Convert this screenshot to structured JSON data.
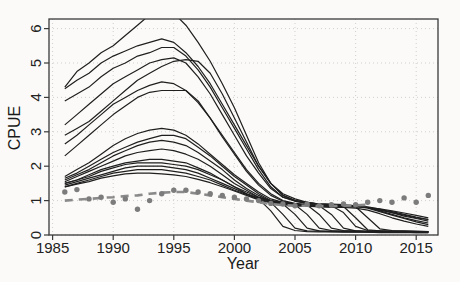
{
  "figure": {
    "kind": "r-base-plot",
    "background": "#fbfaf8"
  },
  "colors": {
    "background": "#fbfaf8",
    "line": "#1f1f1f",
    "points": "#7c7c7c",
    "dashed": "#8a8a8a",
    "grid": "#cfcfcf",
    "frame": "#3a3a3a",
    "text": "#222222"
  },
  "chart_data": {
    "type": "line",
    "title": "",
    "xlabel": "Year",
    "ylabel": "CPUE",
    "xlim": [
      1984.7,
      2016.8
    ],
    "ylim": [
      0,
      6.28
    ],
    "x_ticks": [
      1985,
      1990,
      1995,
      2000,
      2005,
      2010,
      2015
    ],
    "y_ticks": [
      0,
      1,
      2,
      3,
      4,
      5,
      6
    ],
    "grid": "dotted",
    "legend": "none",
    "years": [
      1986,
      1987,
      1988,
      1989,
      1990,
      1991,
      1992,
      1993,
      1994,
      1995,
      1996,
      1997,
      1998,
      1999,
      2000,
      2001,
      2002,
      2003,
      2004,
      2005,
      2006,
      2007,
      2008,
      2009,
      2010,
      2011,
      2012,
      2013,
      2014,
      2015,
      2016
    ],
    "series": [
      {
        "name": "run01",
        "values": [
          4.3,
          4.75,
          5.0,
          5.3,
          5.5,
          5.8,
          6.1,
          6.4,
          6.5,
          6.45,
          6.1,
          5.6,
          5.05,
          4.4,
          3.7,
          2.9,
          2.1,
          1.5,
          1.15,
          1.0,
          0.95,
          0.9,
          0.9,
          0.88,
          0.85,
          0.8,
          0.72,
          0.65,
          0.58,
          0.5,
          0.45
        ]
      },
      {
        "name": "run02",
        "values": [
          4.25,
          4.5,
          4.7,
          5.0,
          5.2,
          5.35,
          5.5,
          5.6,
          5.7,
          5.6,
          5.3,
          4.9,
          4.4,
          3.8,
          3.2,
          2.6,
          2.0,
          1.5,
          1.2,
          1.05,
          0.95,
          0.9,
          0.88,
          0.86,
          0.85,
          0.8,
          0.7,
          0.6,
          0.5,
          0.42,
          0.35
        ]
      },
      {
        "name": "run03",
        "values": [
          3.9,
          4.1,
          4.3,
          4.6,
          4.85,
          5.0,
          5.2,
          5.3,
          5.45,
          5.45,
          5.2,
          4.8,
          4.3,
          3.7,
          3.1,
          2.5,
          1.9,
          1.4,
          1.1,
          1.0,
          0.92,
          0.88,
          0.85,
          0.83,
          0.5,
          0.15,
          0.12,
          0.11,
          0.1,
          0.1,
          0.09
        ]
      },
      {
        "name": "run04",
        "values": [
          3.2,
          3.5,
          3.8,
          4.1,
          4.4,
          4.6,
          4.8,
          5.0,
          5.1,
          5.15,
          5.0,
          4.6,
          4.1,
          3.5,
          2.9,
          2.3,
          1.8,
          1.35,
          1.1,
          0.98,
          0.92,
          0.9,
          0.88,
          0.85,
          0.83,
          0.78,
          0.68,
          0.58,
          0.48,
          0.38,
          0.3
        ]
      },
      {
        "name": "run05",
        "values": [
          2.9,
          3.1,
          3.3,
          3.6,
          3.9,
          4.2,
          4.5,
          4.7,
          4.9,
          5.05,
          5.1,
          5.05,
          4.7,
          4.1,
          3.4,
          2.7,
          2.0,
          1.5,
          1.15,
          1.0,
          0.95,
          0.9,
          0.88,
          0.85,
          0.82,
          0.5,
          0.18,
          0.13,
          0.12,
          0.11,
          0.1
        ]
      },
      {
        "name": "run06",
        "values": [
          2.65,
          2.9,
          3.2,
          3.5,
          3.8,
          4.0,
          4.2,
          4.35,
          4.45,
          4.4,
          4.2,
          3.85,
          3.4,
          2.9,
          2.4,
          1.9,
          1.5,
          1.2,
          1.0,
          0.92,
          0.88,
          0.86,
          0.85,
          0.65,
          0.25,
          0.13,
          0.12,
          0.11,
          0.11,
          0.1,
          0.1
        ]
      },
      {
        "name": "run07",
        "values": [
          2.3,
          2.6,
          2.9,
          3.2,
          3.5,
          3.75,
          4.0,
          4.15,
          4.2,
          4.2,
          4.2,
          3.9,
          3.4,
          2.85,
          2.35,
          1.85,
          1.45,
          1.15,
          0.98,
          0.9,
          0.87,
          0.85,
          0.6,
          0.2,
          0.12,
          0.1,
          0.1,
          0.1,
          0.1,
          0.1,
          0.1
        ]
      },
      {
        "name": "run08",
        "values": [
          1.7,
          1.9,
          2.1,
          2.35,
          2.6,
          2.8,
          2.95,
          3.05,
          3.1,
          3.05,
          2.9,
          2.65,
          2.35,
          2.05,
          1.75,
          1.5,
          1.25,
          1.05,
          0.95,
          0.9,
          0.87,
          0.6,
          0.2,
          0.13,
          0.12,
          0.11,
          0.11,
          0.1,
          0.1,
          0.1,
          0.1
        ]
      },
      {
        "name": "run09",
        "values": [
          1.65,
          1.8,
          2.0,
          2.2,
          2.4,
          2.55,
          2.7,
          2.8,
          2.9,
          2.9,
          2.8,
          2.55,
          2.3,
          2.0,
          1.7,
          1.45,
          1.2,
          1.0,
          0.93,
          0.88,
          0.6,
          0.2,
          0.13,
          0.12,
          0.11,
          0.1,
          0.1,
          0.1,
          0.09,
          0.09,
          0.09
        ]
      },
      {
        "name": "run10",
        "values": [
          1.6,
          1.75,
          1.9,
          2.1,
          2.3,
          2.45,
          2.6,
          2.7,
          2.75,
          2.7,
          2.6,
          2.4,
          2.15,
          1.9,
          1.6,
          1.35,
          1.15,
          0.98,
          0.9,
          0.6,
          0.2,
          0.12,
          0.11,
          0.1,
          0.1,
          0.09,
          0.09,
          0.09,
          0.08,
          0.08,
          0.08
        ]
      },
      {
        "name": "run11",
        "values": [
          1.55,
          1.7,
          1.85,
          2.0,
          2.15,
          2.3,
          2.4,
          2.45,
          2.5,
          2.45,
          2.35,
          2.2,
          2.0,
          1.75,
          1.5,
          1.3,
          1.1,
          0.95,
          0.6,
          0.2,
          0.12,
          0.11,
          0.1,
          0.1,
          0.09,
          0.09,
          0.08,
          0.08,
          0.08,
          0.07,
          0.07
        ]
      },
      {
        "name": "run12",
        "values": [
          1.5,
          1.6,
          1.75,
          1.9,
          2.0,
          2.1,
          2.15,
          2.2,
          2.2,
          2.15,
          2.1,
          1.95,
          1.8,
          1.6,
          1.4,
          1.2,
          1.05,
          0.7,
          0.25,
          0.13,
          0.1,
          0.09,
          0.09,
          0.08,
          0.08,
          0.08,
          0.07,
          0.07,
          0.07,
          0.07,
          0.07
        ]
      },
      {
        "name": "run13",
        "values": [
          1.5,
          1.6,
          1.7,
          1.85,
          1.95,
          2.05,
          2.1,
          2.1,
          2.1,
          2.05,
          2.0,
          1.9,
          1.75,
          1.6,
          1.4,
          1.25,
          1.1,
          1.0,
          0.95,
          0.9,
          0.88,
          0.87,
          0.86,
          0.85,
          0.85,
          0.82,
          0.75,
          0.65,
          0.55,
          0.48,
          0.4
        ]
      },
      {
        "name": "run14",
        "values": [
          1.45,
          1.55,
          1.65,
          1.75,
          1.85,
          1.95,
          2.0,
          2.0,
          2.0,
          1.95,
          1.9,
          1.8,
          1.65,
          1.5,
          1.35,
          1.2,
          1.08,
          0.98,
          0.92,
          0.88,
          0.86,
          0.85,
          0.85,
          0.84,
          0.84,
          0.8,
          0.73,
          0.68,
          0.6,
          0.52,
          0.45
        ]
      },
      {
        "name": "run15",
        "values": [
          1.4,
          1.5,
          1.6,
          1.7,
          1.8,
          1.85,
          1.9,
          1.9,
          1.9,
          1.85,
          1.8,
          1.7,
          1.6,
          1.45,
          1.3,
          1.18,
          1.05,
          0.95,
          0.9,
          0.86,
          0.84,
          0.82,
          0.8,
          0.8,
          0.78,
          0.72,
          0.62,
          0.5,
          0.4,
          0.32,
          0.25
        ]
      },
      {
        "name": "run16",
        "values": [
          1.4,
          1.48,
          1.55,
          1.65,
          1.72,
          1.78,
          1.8,
          1.8,
          1.78,
          1.75,
          1.7,
          1.62,
          1.52,
          1.4,
          1.28,
          1.15,
          1.02,
          0.93,
          0.88,
          0.85,
          0.84,
          0.83,
          0.83,
          0.82,
          0.82,
          0.8,
          0.76,
          0.7,
          0.64,
          0.57,
          0.5
        ]
      }
    ],
    "dashed_line": {
      "name": "reference-index",
      "style": "dashed",
      "years": [
        1986,
        1987,
        1988,
        1989,
        1990,
        1991,
        1992,
        1993,
        1994,
        1995,
        1996,
        1997,
        1998,
        1999,
        2000,
        2001,
        2002,
        2003,
        2004,
        2005,
        2006,
        2007,
        2008,
        2009,
        2010,
        2011
      ],
      "values": [
        1.0,
        1.03,
        1.05,
        1.08,
        1.1,
        1.13,
        1.15,
        1.2,
        1.23,
        1.25,
        1.25,
        1.2,
        1.15,
        1.1,
        1.05,
        1.0,
        0.95,
        0.9,
        0.87,
        0.85,
        0.85,
        0.84,
        0.84,
        0.85,
        0.86,
        0.88
      ]
    },
    "observed_points": {
      "name": "observed-cpue",
      "marker": "filled-circle",
      "values": [
        1.25,
        1.32,
        1.05,
        1.1,
        0.95,
        1.05,
        0.75,
        1.0,
        1.2,
        1.3,
        1.3,
        1.25,
        1.2,
        1.15,
        1.1,
        1.05,
        1.0,
        0.92,
        0.9,
        0.85,
        0.9,
        0.85,
        0.88,
        0.9,
        0.88,
        0.95,
        1.0,
        0.95,
        1.08,
        0.95,
        1.15
      ]
    }
  }
}
